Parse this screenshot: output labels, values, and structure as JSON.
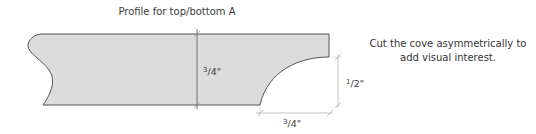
{
  "title": "Profile for top/bottom A",
  "note": {
    "lines": [
      "Cut the cove asymmetrically to",
      "add visual interest."
    ]
  },
  "dimensions": {
    "thickness": {
      "numerator": "3",
      "denominator": "4",
      "unit": "\""
    },
    "cove_height": {
      "numerator": "1",
      "denominator": "2",
      "unit": "\""
    },
    "cove_width": {
      "numerator": "3",
      "denominator": "4",
      "unit": "\""
    }
  },
  "colors": {
    "profile_fill": "#dcdcdc",
    "profile_stroke": "#555555",
    "dimension_line": "#b0b0b0",
    "text": "#3c3c3c"
  }
}
